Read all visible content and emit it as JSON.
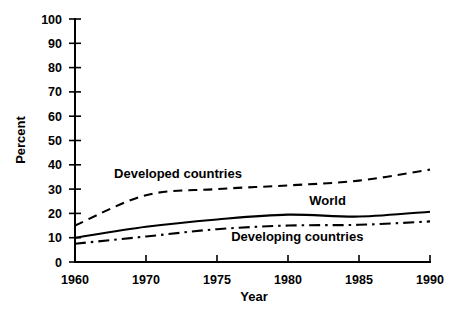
{
  "chart_data": {
    "type": "line",
    "title": "",
    "xlabel": "Year",
    "ylabel": "Percent",
    "categories": [
      "1960",
      "1970",
      "1975",
      "1980",
      "1985",
      "1990"
    ],
    "x": [
      1960,
      1970,
      1975,
      1980,
      1985,
      1990
    ],
    "xtick_labels": [
      "1960",
      "1970",
      "1975",
      "1980",
      "1985",
      "1990"
    ],
    "ytick_labels": [
      "0",
      "10",
      "20",
      "30",
      "40",
      "50",
      "60",
      "70",
      "80",
      "90",
      "100"
    ],
    "ytick_values": [
      0,
      10,
      20,
      30,
      40,
      50,
      60,
      70,
      80,
      90,
      100
    ],
    "ylim": [
      0,
      100
    ],
    "grid": false,
    "legend_position": "inline-annotations",
    "axis_spacing": "categorical-even",
    "series": [
      {
        "name": "Developed countries",
        "style": "dashed",
        "color": "#000000",
        "values": [
          15.0,
          27.5,
          30.0,
          31.5,
          33.5,
          38.0
        ],
        "annotation": "Developed countries"
      },
      {
        "name": "World",
        "style": "solid",
        "color": "#000000",
        "values": [
          10.0,
          14.5,
          17.5,
          19.5,
          18.7,
          20.7
        ],
        "annotation": "World"
      },
      {
        "name": "Developing countries",
        "style": "dash-dot",
        "color": "#000000",
        "values": [
          7.5,
          10.5,
          13.5,
          15.0,
          15.3,
          16.7
        ],
        "annotation": "Developing countries"
      }
    ],
    "annotations": [
      {
        "text": "Developed countries",
        "x_frac": 0.11,
        "y_px": 178
      },
      {
        "text": "World",
        "x_frac": 0.66,
        "y_px": 205
      },
      {
        "text": "Developing countries",
        "x_frac": 0.44,
        "y_px": 241
      }
    ]
  }
}
